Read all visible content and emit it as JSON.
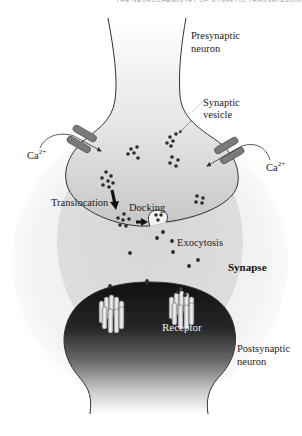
{
  "header": {
    "running_head": "THE NEUROCHEMISTRY OF SYNAPTIC TRANSMISSION"
  },
  "labels": {
    "presynaptic": [
      "Presynaptic",
      "neuron"
    ],
    "synaptic_vesicle": [
      "Synaptic",
      "vesicle"
    ],
    "calcium_left": {
      "base": "Ca",
      "sup": "2+"
    },
    "calcium_right": {
      "base": "Ca",
      "sup": "2+"
    },
    "translocation": "Translocation",
    "docking": "Docking",
    "exocytosis": "Exocytosis",
    "synapse": "Synapse",
    "receptor": "Receptor",
    "postsynaptic": [
      "Postsynaptic",
      "neuron"
    ]
  },
  "colors": {
    "background": "#ffffff",
    "outer_halo": "#f1f1f1",
    "synapse_zone": "#dcdcdc",
    "presynaptic_terminal": "#c4c4c4",
    "postsynaptic_dark": "#1a1a1a",
    "postsynaptic_light": "#f0f0f0",
    "channel": "#7a7a7a",
    "vesicle_dot": "#2a2a2a",
    "receptor_fill": "#d8d8d8"
  }
}
